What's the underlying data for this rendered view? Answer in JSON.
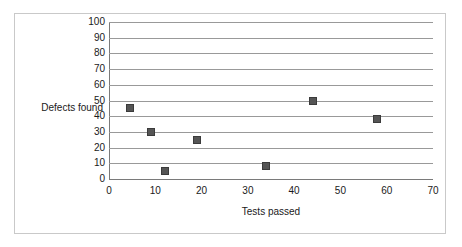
{
  "chart_data": {
    "type": "scatter",
    "title": "",
    "xlabel": "Tests passed",
    "ylabel": "Defects found",
    "xlim": [
      0,
      70
    ],
    "ylim": [
      0,
      100
    ],
    "xticks": [
      0,
      10,
      20,
      30,
      40,
      50,
      60,
      70
    ],
    "yticks": [
      0,
      10,
      20,
      30,
      40,
      50,
      60,
      70,
      80,
      90,
      100
    ],
    "grid": "horizontal",
    "legend": "none",
    "marker_style": "filled-square",
    "marker_color": "#555555",
    "points": [
      {
        "x": 4.5,
        "y": 45
      },
      {
        "x": 9,
        "y": 30
      },
      {
        "x": 12,
        "y": 5
      },
      {
        "x": 19,
        "y": 25
      },
      {
        "x": 34,
        "y": 8
      },
      {
        "x": 44,
        "y": 50
      },
      {
        "x": 58,
        "y": 38
      }
    ],
    "series": [
      {
        "name": "Defects found",
        "x": [
          4.5,
          9,
          12,
          19,
          34,
          44,
          58
        ],
        "values": [
          45,
          30,
          5,
          25,
          8,
          50,
          38
        ]
      }
    ]
  },
  "axes": {
    "x_tick_labels": [
      "0",
      "10",
      "20",
      "30",
      "40",
      "50",
      "60",
      "70"
    ],
    "y_tick_labels": [
      "100",
      "90",
      "80",
      "70",
      "60",
      "50",
      "40",
      "30",
      "20",
      "10",
      "0"
    ],
    "x_title": "Tests passed",
    "y_title": "Defects found"
  },
  "colors": {
    "marker": "#555555",
    "marker_border": "#3b3b3b",
    "gridline": "#999999",
    "axis": "#7a7a7a",
    "frame": "#c9c9c9",
    "text": "#1a1a1a",
    "background": "#ffffff"
  }
}
